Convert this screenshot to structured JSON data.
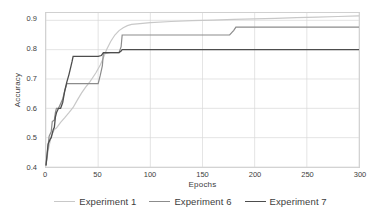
{
  "chart_data": {
    "type": "line",
    "title": "",
    "xlabel": "Epochs",
    "ylabel": "Accuracy",
    "xlim": [
      0,
      300
    ],
    "ylim": [
      0.4,
      0.925
    ],
    "xticks": [
      0,
      50,
      100,
      150,
      200,
      250,
      300
    ],
    "xtick_labels": [
      "0",
      "50",
      "100",
      "150",
      "200",
      "250",
      "300"
    ],
    "yticks": [
      0.4,
      0.5,
      0.6,
      0.7,
      0.8,
      0.9
    ],
    "ytick_labels": [
      "0.4",
      "0.5",
      "0.6",
      "0.7",
      "0.8",
      "0.9"
    ],
    "grid": true,
    "grid_color": "#d9d9d9",
    "legend_position": "bottom",
    "series": [
      {
        "name": "Experiment 1",
        "color": "#c8c8c8",
        "width": 1.2,
        "x": [
          0,
          2,
          5,
          8,
          10,
          14,
          18,
          22,
          26,
          30,
          34,
          38,
          42,
          45,
          48,
          52,
          55,
          58,
          62,
          66,
          70,
          74,
          78,
          82,
          90,
          100,
          120,
          140,
          160,
          180,
          200,
          220,
          240,
          260,
          280,
          300
        ],
        "y": [
          0.405,
          0.455,
          0.505,
          0.528,
          0.533,
          0.552,
          0.568,
          0.585,
          0.603,
          0.628,
          0.652,
          0.672,
          0.69,
          0.706,
          0.722,
          0.748,
          0.772,
          0.8,
          0.828,
          0.85,
          0.865,
          0.875,
          0.882,
          0.886,
          0.889,
          0.892,
          0.896,
          0.899,
          0.901,
          0.903,
          0.905,
          0.907,
          0.909,
          0.911,
          0.913,
          0.915
        ]
      },
      {
        "name": "Experiment 6",
        "color": "#8c8c8c",
        "width": 1.2,
        "x": [
          0,
          3,
          5,
          6,
          8,
          9,
          10,
          12,
          16,
          18,
          20,
          24,
          30,
          40,
          50,
          52,
          54,
          55,
          58,
          62,
          66,
          70,
          72,
          73,
          100,
          140,
          176,
          178,
          180,
          182,
          200,
          240,
          300
        ],
        "y": [
          0.405,
          0.505,
          0.52,
          0.555,
          0.56,
          0.585,
          0.6,
          0.6,
          0.632,
          0.66,
          0.684,
          0.684,
          0.684,
          0.684,
          0.684,
          0.712,
          0.745,
          0.788,
          0.788,
          0.79,
          0.79,
          0.79,
          0.81,
          0.85,
          0.85,
          0.85,
          0.85,
          0.858,
          0.866,
          0.877,
          0.877,
          0.877,
          0.877
        ]
      },
      {
        "name": "Experiment 7",
        "color": "#4d4d4d",
        "width": 1.3,
        "x": [
          0,
          2,
          4,
          5,
          7,
          8,
          9,
          10,
          12,
          14,
          16,
          18,
          20,
          22,
          24,
          25,
          26,
          30,
          40,
          50,
          53,
          55,
          58,
          65,
          70,
          72,
          73,
          100,
          150,
          200,
          250,
          300
        ],
        "y": [
          0.405,
          0.478,
          0.495,
          0.5,
          0.528,
          0.535,
          0.57,
          0.585,
          0.6,
          0.6,
          0.62,
          0.66,
          0.69,
          0.715,
          0.745,
          0.76,
          0.777,
          0.777,
          0.777,
          0.777,
          0.78,
          0.79,
          0.79,
          0.79,
          0.79,
          0.795,
          0.8,
          0.8,
          0.8,
          0.8,
          0.8,
          0.8
        ]
      }
    ]
  },
  "axes": {
    "ylabel": "Accuracy",
    "xlabel": "Epochs"
  },
  "legend": {
    "entries": [
      {
        "label": "Experiment 1",
        "color": "#c8c8c8"
      },
      {
        "label": "Experiment 6",
        "color": "#8c8c8c"
      },
      {
        "label": "Experiment 7",
        "color": "#4d4d4d"
      }
    ]
  }
}
